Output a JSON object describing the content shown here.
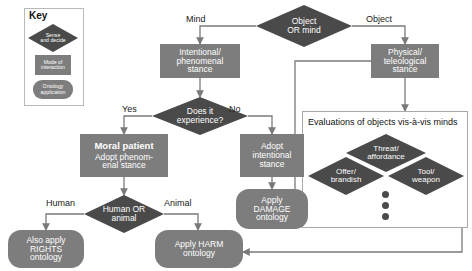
{
  "figure": {
    "type": "flowchart",
    "background": "#ffffff",
    "colors": {
      "decision_shape": "#4a4a4a",
      "interaction_shape": "#7d7d7d",
      "ontology_shape": "#7d7d7d",
      "shape_text": "#ffffff",
      "edge_label_text": "#1a1a1a",
      "connector": "#7a7a7a",
      "panel_border": "#a8a8a8"
    }
  },
  "key": {
    "title": "Key",
    "items": [
      {
        "shape": "diamond",
        "label": "Sense and decide",
        "line1": "Sense",
        "line2": "and decide"
      },
      {
        "shape": "rectangle",
        "label": "Mode of interaction",
        "line1": "Mode of",
        "line2": "interaction"
      },
      {
        "shape": "rounded-rectangle",
        "label": "Ontology application",
        "line1": "Ontology",
        "line2": "application"
      }
    ]
  },
  "nodes": {
    "object_or_mind": {
      "label": "Object OR mind",
      "line1": "Object",
      "line2": "OR mind",
      "shape": "diamond"
    },
    "intentional_stance": {
      "label": "Intentional/ phenomenal stance",
      "line1": "Intentional/",
      "line2": "phenomenal",
      "line3": "stance",
      "shape": "rectangle"
    },
    "physical_stance": {
      "label": "Physical/ teleological stance",
      "line1": "Physical/",
      "line2": "teleological",
      "line3": "stance",
      "shape": "rectangle"
    },
    "does_it_experience": {
      "label": "Does it experience?",
      "line1": "Does it",
      "line2": "experience?",
      "shape": "diamond"
    },
    "moral_patient": {
      "title": "Moral patient",
      "line1": "Adopt phenom-",
      "line2": "enal stance",
      "shape": "rectangle"
    },
    "adopt_intentional": {
      "label": "Adopt intentional stance",
      "line1": "Adopt",
      "line2": "intentional",
      "line3": "stance",
      "shape": "rectangle"
    },
    "apply_damage": {
      "label": "Apply DAMAGE ontology",
      "line1": "Apply",
      "line2": "DAMAGE",
      "line3": "ontology",
      "shape": "rounded-rectangle"
    },
    "human_or_animal": {
      "label": "Human OR animal",
      "line1": "Human OR",
      "line2": "animal",
      "shape": "diamond"
    },
    "also_apply_rights": {
      "label": "Also apply RIGHTS ontology",
      "line1": "Also apply",
      "line2": "RIGHTS",
      "line3": "ontology",
      "shape": "rounded-rectangle"
    },
    "apply_harm": {
      "label": "Apply HARM ontology",
      "line1": "Apply HARM",
      "line2": "ontology",
      "shape": "rounded-rectangle"
    },
    "threat_affordance": {
      "label": "Threat/ affordance",
      "line1": "Threat/",
      "line2": "affordance",
      "shape": "diamond"
    },
    "offer_brandish": {
      "label": "Offer/ brandish",
      "line1": "Offer/",
      "line2": "brandish",
      "shape": "diamond"
    },
    "tool_weapon": {
      "label": "Tool/ weapon",
      "line1": "Tool/",
      "line2": "weapon",
      "shape": "diamond"
    }
  },
  "panel": {
    "title": "Evaluations of objects vis-à-vis minds",
    "ellipsis": "three vertical dots"
  },
  "edge_labels": {
    "mind": "Mind",
    "object": "Object",
    "yes": "Yes",
    "no": "No",
    "human": "Human",
    "animal": "Animal"
  }
}
